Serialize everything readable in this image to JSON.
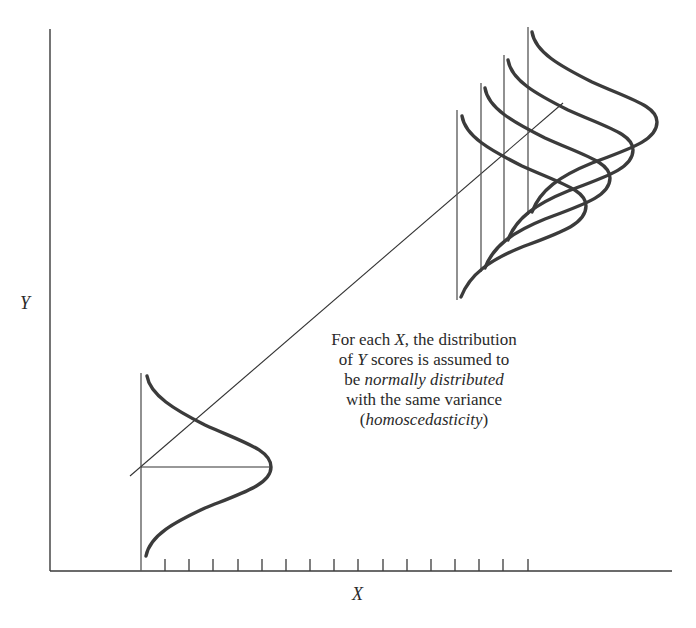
{
  "axes": {
    "x_label": "X",
    "y_label": "Y",
    "x_tick_count": 16
  },
  "annotation": {
    "line1_pre": "For each ",
    "line1_var": "X",
    "line1_post": ", the distribution",
    "line2_pre": "of ",
    "line2_var": "Y",
    "line2_post": " scores is assumed to",
    "line3_pre": "be ",
    "line3_em": "normally distributed",
    "line4": "with the same variance",
    "line5_open": "(",
    "line5_em": "homoscedasticity",
    "line5_close": ")"
  },
  "colors": {
    "ink": "#3b3b3b",
    "background": "#ffffff"
  }
}
